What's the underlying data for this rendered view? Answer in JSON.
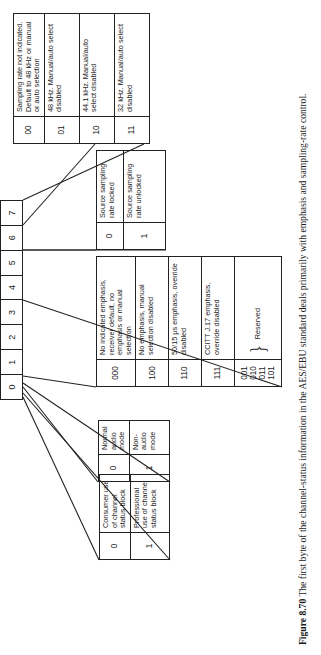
{
  "figure": {
    "bits": [
      "0",
      "1",
      "2",
      "3",
      "4",
      "5",
      "6",
      "7"
    ],
    "tables": {
      "bit0": {
        "rows": [
          {
            "code": "0",
            "desc": "Consumer use of channel status block"
          },
          {
            "code": "1",
            "desc": "Professional use of channel status block"
          }
        ]
      },
      "bit1": {
        "rows": [
          {
            "code": "0",
            "desc": "Normal audio mode"
          },
          {
            "code": "1",
            "desc": "Non-audio mode"
          }
        ]
      },
      "emphasis": {
        "rows": [
          {
            "code": "000",
            "desc": "No indicated emphasis, receiver default, no emphasis or manual selection"
          },
          {
            "code": "100",
            "desc": "No emphasis, manual selection disabled"
          },
          {
            "code": "110",
            "desc": "50/15 µs emphasis, override disabled"
          },
          {
            "code": "111",
            "desc": "CCITT J.17 emphasis, override disabled"
          }
        ],
        "reserved": {
          "codes": [
            "001",
            "010",
            "011",
            "101"
          ],
          "label": "Reserved"
        }
      },
      "bit5": {
        "rows": [
          {
            "code": "0",
            "desc": "Source sampling rate locked"
          },
          {
            "code": "1",
            "desc": "Source sampling rate unlocked"
          }
        ]
      },
      "sampling": {
        "rows": [
          {
            "code": "00",
            "desc": "Sampling rate not indicated. Default to 48 kHz or manual or auto selection"
          },
          {
            "code": "01",
            "desc": "48 kHz. Manual/auto select disabled"
          },
          {
            "code": "10",
            "desc": "44.1 kHz. Manual/auto select disabled"
          },
          {
            "code": "11",
            "desc": "32 kHz. Manual/auto select disabled"
          }
        ]
      }
    },
    "caption": {
      "label": "Figure 8.70",
      "text": "The first byte of the channel-status information in the AES/EBU standard deals primarily with emphasis and sampling-rate control."
    }
  }
}
